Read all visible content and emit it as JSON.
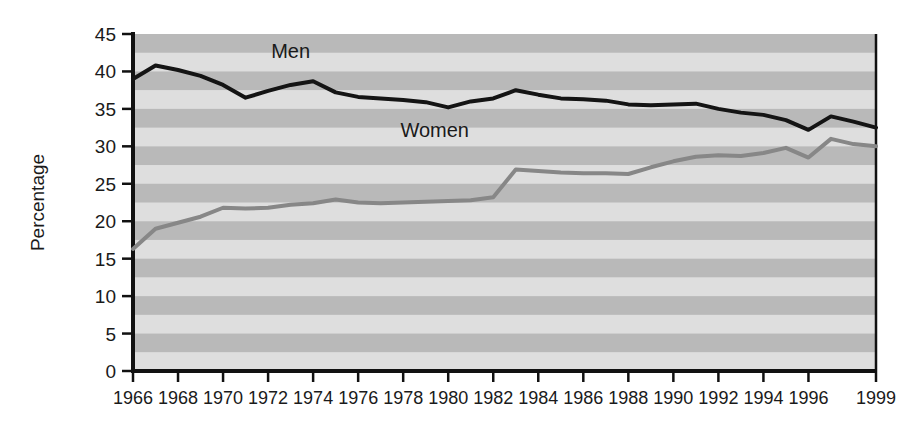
{
  "chart_data": {
    "type": "line",
    "title": "",
    "xlabel": "",
    "ylabel": "Percentage",
    "xlim": [
      1966,
      1999
    ],
    "ylim": [
      0,
      45
    ],
    "grid": false,
    "background_bands": {
      "style": "alternating horizontal stripes",
      "band_height_units": 2.5,
      "dark_color": "#b9b9b9",
      "light_color": "#dedede"
    },
    "legend_position": "inline-labels",
    "x_tick_labels": [
      "1966",
      "1968",
      "1970",
      "1972",
      "1974",
      "1976",
      "1978",
      "1980",
      "1982",
      "1984",
      "1986",
      "1988",
      "1990",
      "1992",
      "1994",
      "1996",
      "1999"
    ],
    "x_tick_values": [
      1966,
      1968,
      1970,
      1972,
      1974,
      1976,
      1978,
      1980,
      1982,
      1984,
      1986,
      1988,
      1990,
      1992,
      1994,
      1996,
      1999
    ],
    "y_tick_labels": [
      "0",
      "5",
      "10",
      "15",
      "20",
      "25",
      "30",
      "35",
      "40",
      "45"
    ],
    "y_tick_values": [
      0,
      5,
      10,
      15,
      20,
      25,
      30,
      35,
      40,
      45
    ],
    "x": [
      1966,
      1967,
      1968,
      1969,
      1970,
      1971,
      1972,
      1973,
      1974,
      1975,
      1976,
      1977,
      1978,
      1979,
      1980,
      1981,
      1982,
      1983,
      1984,
      1985,
      1986,
      1987,
      1988,
      1989,
      1990,
      1991,
      1992,
      1993,
      1994,
      1995,
      1996,
      1997,
      1998,
      1999
    ],
    "series": [
      {
        "name": "Men",
        "color": "#141414",
        "line_width": 4,
        "label_x": 1973.0,
        "label_y": 41.8,
        "values": [
          39.0,
          40.8,
          40.2,
          39.4,
          38.2,
          36.5,
          37.4,
          38.2,
          38.7,
          37.2,
          36.6,
          36.4,
          36.2,
          35.9,
          35.2,
          36.0,
          36.4,
          37.5,
          36.9,
          36.4,
          36.3,
          36.1,
          35.6,
          35.5,
          35.6,
          35.7,
          35.0,
          34.5,
          34.2,
          33.5,
          32.2,
          34.0,
          33.3,
          32.5
        ]
      },
      {
        "name": "Women",
        "color": "#878787",
        "line_width": 4,
        "label_x": 1979.4,
        "label_y": 31.3,
        "values": [
          16.3,
          19.0,
          19.8,
          20.6,
          21.8,
          21.7,
          21.8,
          22.2,
          22.4,
          22.9,
          22.5,
          22.4,
          22.5,
          22.6,
          22.7,
          22.8,
          23.2,
          26.9,
          26.7,
          26.5,
          26.4,
          26.4,
          26.3,
          27.2,
          28.0,
          28.6,
          28.8,
          28.7,
          29.1,
          29.8,
          28.5,
          31.0,
          30.3,
          30.0
        ]
      }
    ]
  },
  "axes": {
    "y_axis_title": "Percentage"
  }
}
